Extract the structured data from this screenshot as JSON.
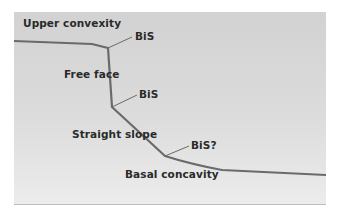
{
  "diagram": {
    "type": "hillslope-profile",
    "colors": {
      "panel_top": "#d2d2d2",
      "panel_bottom": "#ececec",
      "profile_line": "#6a6a6a",
      "text": "#2a2a2a"
    },
    "labels": {
      "upper_convexity": "Upper convexity",
      "free_face": "Free face",
      "straight_slope": "Straight slope",
      "basal_concavity": "Basal concavity",
      "bis_1": "BiS",
      "bis_2": "BiS",
      "bis_3": "BiS?"
    }
  }
}
